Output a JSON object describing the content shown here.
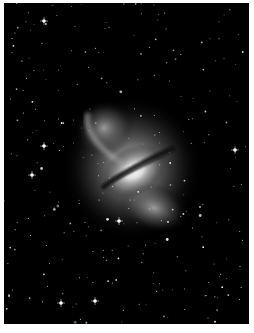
{
  "image": {
    "subject": "galaxy-centaurus-a",
    "description": "Grayscale astronomical photograph of an elliptical galaxy with a dark dust lane and bright lobes, surrounded by a field of stars",
    "colors": {
      "background": "#000000",
      "border": "#ffffff",
      "glow": "#ffffff"
    }
  }
}
